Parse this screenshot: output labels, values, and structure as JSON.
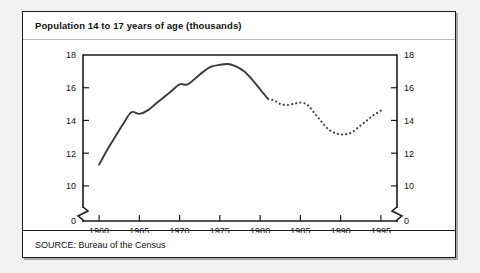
{
  "figure": {
    "title": "Population 14 to 17 years of age (thousands)",
    "source": "SOURCE: Bureau of the Census"
  },
  "chart_data": {
    "type": "line",
    "title": "Population 14 to 17 years of age (thousands)",
    "xlabel": "",
    "ylabel": "",
    "xlim": [
      1958,
      1997
    ],
    "ylim": [
      9.2,
      18
    ],
    "yticks": [
      10,
      12,
      14,
      16,
      18
    ],
    "ytick_labels": [
      "10",
      "12",
      "14",
      "16",
      "18"
    ],
    "y_axis_break": true,
    "y_axis_base_label": "0",
    "xticks": [
      1960,
      1965,
      1970,
      1975,
      1980,
      1985,
      1990,
      1995
    ],
    "xtick_labels": [
      "1960",
      "1965",
      "1970",
      "1975",
      "1980",
      "1985",
      "1990",
      "1995"
    ],
    "grid": false,
    "legend": false,
    "dual_y_axis": true,
    "series": [
      {
        "name": "Actual",
        "style": "solid",
        "x": [
          1960,
          1961,
          1962,
          1963,
          1964,
          1965,
          1966,
          1967,
          1968,
          1969,
          1970,
          1971,
          1972,
          1973,
          1974,
          1975,
          1976,
          1977,
          1978,
          1979,
          1980,
          1981
        ],
        "values": [
          11.3,
          12.2,
          13.0,
          13.8,
          14.5,
          14.4,
          14.6,
          15.0,
          15.4,
          15.8,
          16.2,
          16.2,
          16.6,
          17.0,
          17.3,
          17.4,
          17.45,
          17.3,
          17.0,
          16.5,
          15.9,
          15.3
        ]
      },
      {
        "name": "Projected",
        "style": "dotted",
        "x": [
          1981.5,
          1982,
          1982.5,
          1983,
          1983.5,
          1984,
          1984.5,
          1985,
          1985.5,
          1986,
          1986.5,
          1987,
          1987.5,
          1988,
          1988.5,
          1989,
          1989.5,
          1990,
          1990.5,
          1991,
          1991.5,
          1992,
          1992.5,
          1993,
          1993.5,
          1994,
          1994.5,
          1995
        ],
        "values": [
          15.25,
          15.15,
          15.0,
          14.95,
          14.95,
          15.0,
          15.05,
          15.1,
          15.05,
          14.9,
          14.6,
          14.3,
          14.0,
          13.7,
          13.45,
          13.3,
          13.2,
          13.15,
          13.15,
          13.2,
          13.3,
          13.5,
          13.7,
          13.9,
          14.1,
          14.3,
          14.45,
          14.6
        ]
      }
    ]
  }
}
